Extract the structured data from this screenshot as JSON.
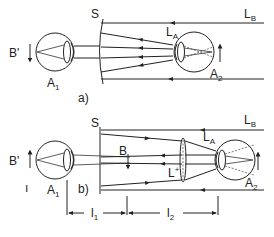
{
  "diagram": {
    "panels": [
      {
        "id": "a",
        "caption": "a)",
        "labels": {
          "screen": "S",
          "beam_b": "L",
          "beam_b_sub": "B",
          "beam_a": "L",
          "beam_a_sub": "A",
          "image": "B'",
          "eye1": "A",
          "eye1_sub": "1",
          "eye2": "A",
          "eye2_sub": "2"
        }
      },
      {
        "id": "b",
        "caption": "b)",
        "labels": {
          "screen": "S",
          "beam_b": "L",
          "beam_b_sub": "B",
          "beam_a": "L",
          "beam_a_sub": "A",
          "image": "B'",
          "intermediate_image": "B",
          "lens": "L",
          "lens_sup": "+",
          "eye1": "A",
          "eye1_sub": "1",
          "eye2": "A",
          "eye2_sub": "2",
          "dist1": "l",
          "dist1_sub": "1",
          "dist2": "l",
          "dist2_sub": "2",
          "tick_mark": "ı"
        }
      }
    ],
    "colors": {
      "ink": "#222222",
      "background": "#ffffff"
    }
  }
}
